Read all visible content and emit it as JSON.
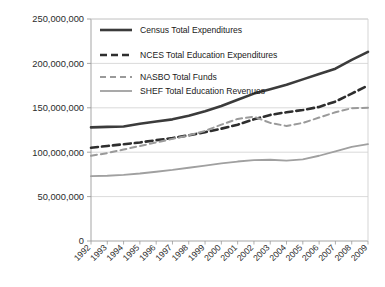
{
  "chart_data": {
    "type": "line",
    "title": "",
    "subtitle": "",
    "xlabel": "",
    "ylabel": "",
    "grid": true,
    "legend_position": "top-left-inside",
    "ylim": [
      0,
      250000000
    ],
    "yticks": [
      0,
      50000000,
      100000000,
      150000000,
      200000000,
      250000000
    ],
    "ytick_labels": [
      "0",
      "50,000,000",
      "100,000,000",
      "150,000,000",
      "200,000,000",
      "250,000,000"
    ],
    "categories": [
      "1992",
      "1993",
      "1994",
      "1995",
      "1996",
      "1997",
      "1998",
      "1999",
      "2000",
      "2001",
      "2002",
      "2003",
      "2004",
      "2005",
      "2006",
      "2007",
      "2008",
      "2009"
    ],
    "x": [
      1992,
      1993,
      1994,
      1995,
      1996,
      1997,
      1998,
      1999,
      2000,
      2001,
      2002,
      2003,
      2004,
      2005,
      2006,
      2007,
      2008,
      2009
    ],
    "series": [
      {
        "name": "Census Total Expenditures",
        "color": "#3b3b3b",
        "width": 2.6,
        "dash": "none",
        "values": [
          128000000,
          128500000,
          129000000,
          132000000,
          134500000,
          137000000,
          141000000,
          146000000,
          152000000,
          159000000,
          166000000,
          171000000,
          176000000,
          182000000,
          188000000,
          194000000,
          204000000,
          213000000
        ]
      },
      {
        "name": "NCES Total Education Expenditures",
        "color": "#2e2e2e",
        "width": 2.6,
        "dash": "7,4",
        "values": [
          105000000,
          107000000,
          109000000,
          111000000,
          113500000,
          116000000,
          119000000,
          122500000,
          126500000,
          131000000,
          137000000,
          142000000,
          145000000,
          147500000,
          151000000,
          157000000,
          166000000,
          175000000
        ]
      },
      {
        "name": "NASBO Total Funds",
        "color": "#9a9a9a",
        "width": 2.0,
        "dash": "6,4",
        "values": [
          96000000,
          99000000,
          103000000,
          107000000,
          111000000,
          115000000,
          119000000,
          124000000,
          131000000,
          137500000,
          140000000,
          133000000,
          129500000,
          133000000,
          139000000,
          145000000,
          149500000,
          150000000
        ]
      },
      {
        "name": "SHEF Total Education Revenues",
        "color": "#a0a0a0",
        "width": 1.8,
        "dash": "none",
        "values": [
          73000000,
          73500000,
          74500000,
          76000000,
          78000000,
          80000000,
          82500000,
          85000000,
          87500000,
          89500000,
          91000000,
          91500000,
          90500000,
          92000000,
          96000000,
          101000000,
          106000000,
          109000000
        ]
      }
    ]
  },
  "legend": {
    "items": [
      {
        "label": "Census Total Expenditures"
      },
      {
        "label": "NCES Total Education Expenditures"
      },
      {
        "label": "NASBO Total Funds"
      },
      {
        "label": "SHEF Total Education Revenues"
      }
    ]
  },
  "axes": {
    "y_tick_labels": [
      "250,000,000",
      "200,000,000",
      "150,000,000",
      "100,000,000",
      "50,000,000",
      "0"
    ],
    "x_tick_labels": [
      "1992",
      "1993",
      "1994",
      "1995",
      "1996",
      "1997",
      "1998",
      "1999",
      "2000",
      "2001",
      "2002",
      "2003",
      "2004",
      "2005",
      "2006",
      "2007",
      "2008",
      "2009"
    ]
  },
  "colors": {
    "census": "#3b3b3b",
    "nces": "#2e2e2e",
    "nasbo": "#9a9a9a",
    "shef": "#a0a0a0",
    "grid": "#d0d0d0",
    "axis": "#9b9b9b",
    "background": "#ffffff"
  }
}
